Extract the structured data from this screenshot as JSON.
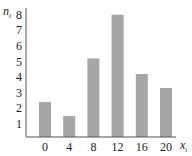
{
  "chart_data": {
    "type": "bar",
    "title": "",
    "xlabel": "x",
    "xlabel_subscript": "i",
    "ylabel": "n",
    "ylabel_subscript": "i",
    "categories": [
      "0",
      "4",
      "8",
      "12",
      "16",
      "20"
    ],
    "values": [
      2.4,
      1.5,
      5.2,
      8.0,
      4.2,
      3.3
    ],
    "yticks": [
      "1",
      "2",
      "3",
      "4",
      "5",
      "6",
      "7",
      "8"
    ],
    "ylim": [
      0,
      8
    ],
    "grid": false,
    "legend": "none",
    "bar_color": "#a6a6a6",
    "axis_color": "#555555"
  }
}
